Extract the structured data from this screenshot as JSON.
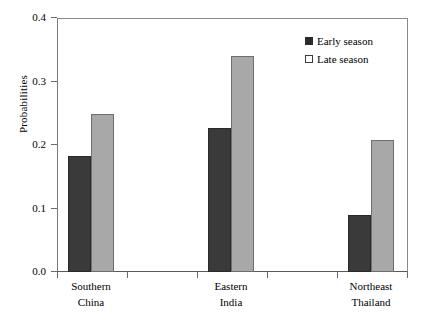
{
  "chart_data": {
    "type": "bar",
    "title": "",
    "subtitle": "",
    "xlabel": "",
    "ylabel": "Probabilities",
    "ylim": [
      0.0,
      0.4
    ],
    "grid": false,
    "legend_position": "top-right",
    "categories": [
      "Southern China",
      "Eastern India",
      "Northeast Thailand"
    ],
    "category_lines": [
      [
        "Southern",
        "China"
      ],
      [
        "Eastern",
        "India"
      ],
      [
        "Northeast",
        "Thailand"
      ]
    ],
    "series": [
      {
        "name": "Early season",
        "color": "#3a3a3a",
        "values": [
          0.183,
          0.227,
          0.09
        ]
      },
      {
        "name": "Late season",
        "color": "#a8a8a8",
        "values": [
          0.249,
          0.34,
          0.208
        ]
      }
    ],
    "ytick_labels": [
      "0.4",
      "0.3",
      "0.2",
      "0.1",
      "0.0"
    ],
    "ytick_values": [
      0.4,
      0.3,
      0.2,
      0.1,
      0.0
    ]
  },
  "legend": {
    "entries": [
      {
        "label": "Early season"
      },
      {
        "label": "Late season"
      }
    ]
  },
  "axes": {
    "y_title": "Probabilities",
    "y_ticks": [
      {
        "label": "0.4"
      },
      {
        "label": "0.3"
      },
      {
        "label": "0.2"
      },
      {
        "label": "0.1"
      },
      {
        "label": "0.0"
      }
    ],
    "x_groups": [
      {
        "line1": "Southern",
        "line2": "China"
      },
      {
        "line1": "Eastern",
        "line2": "India"
      },
      {
        "line1": "Northeast",
        "line2": "Thailand"
      }
    ]
  }
}
